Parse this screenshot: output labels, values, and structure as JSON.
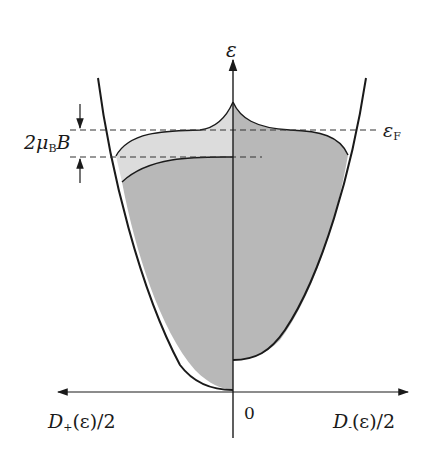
{
  "figure": {
    "type": "density-of-states diagram (Pauli paramagnetism)",
    "clipped_header_text": "",
    "axes": {
      "vertical_label": "ε",
      "origin_label": "0",
      "left_label": {
        "main": "D",
        "sub": "+",
        "rest": "(ε)/2"
      },
      "right_label": {
        "main": "D",
        "sub": "-",
        "rest": "(ε)/2"
      }
    },
    "annotations": {
      "fermi_level": {
        "main": "ε",
        "sub": "F"
      },
      "splitting": {
        "prefix": "2μ",
        "sub": "B",
        "suffix": "B"
      }
    },
    "colors": {
      "outline": "#1a1a1a",
      "fill_dark": "#b8b8b8",
      "fill_light": "#dcdcdc",
      "dash": "#333333",
      "background": "#ffffff"
    }
  }
}
